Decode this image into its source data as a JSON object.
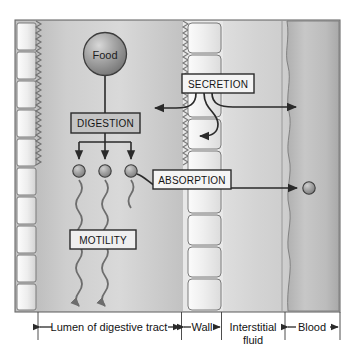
{
  "figure": {
    "boxes": {
      "digestion": "DIGESTION",
      "motility": "MOTILITY",
      "secretion": "SECRETION",
      "absorption": "ABSORPTION"
    },
    "food_label": "Food",
    "regions": [
      {
        "key": "lumen",
        "label": "Lumen of digestive tract",
        "x_start": 38,
        "x_end": 180
      },
      {
        "key": "wall",
        "label": "Wall",
        "x_start": 183,
        "x_end": 221
      },
      {
        "key": "interstitial",
        "label": "Interstitial fluid",
        "line1": "Interstitial",
        "line2": "fluid",
        "x_start": 223,
        "x_end": 284
      },
      {
        "key": "blood",
        "label": "Blood",
        "x_start": 287,
        "x_end": 340
      }
    ],
    "colors": {
      "lumen_fill": "#c9c9c9",
      "wall_fill": "#e3e3e3",
      "interstitial_fill": "#d6d6d6",
      "blood_fill": "#bdbdbd",
      "box_fill_dark": "#c4c4c4",
      "box_fill_light": "#f2f2f2",
      "stroke": "#2a2a2a",
      "sphere": "#9a9a9a",
      "frame": "#6b6b6b"
    },
    "particles": {
      "count": 3,
      "label": "nutrient molecule",
      "blood_particle_label": "absorbed nutrient in blood"
    },
    "arrows": {
      "secretion_to_lumen": "secretion into lumen",
      "secretion_to_blood": "secretion into blood",
      "secretion_to_interstitial": "secretion into interstitial fluid",
      "absorption_to_blood": "absorption into blood",
      "food_to_digestion": "food to digestion",
      "digestion_to_particles": "digestion products"
    }
  }
}
